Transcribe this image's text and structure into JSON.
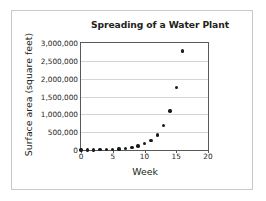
{
  "chart_data": {
    "type": "scatter",
    "title": "Spreading of a Water Plant",
    "xlabel": "Week",
    "ylabel": "Surface area (square feet)",
    "x": [
      0,
      1,
      2,
      3,
      4,
      5,
      6,
      7,
      8,
      9,
      10,
      11,
      12,
      13,
      14,
      15,
      16
    ],
    "values": [
      1000,
      2000,
      4000,
      8000,
      16000,
      31000,
      62000,
      125000,
      12000,
      25000,
      100000,
      175000,
      265000,
      420000,
      680000,
      1090000,
      1750000
    ],
    "series": [
      {
        "name": "Surface area",
        "values": [
          1000,
          2000,
          4000,
          8000,
          16000,
          20000,
          30000,
          45000,
          70000,
          110000,
          175000,
          265000,
          420000,
          680000,
          1090000,
          1750000,
          2780000
        ]
      }
    ],
    "xlim": [
      0,
      20
    ],
    "ylim": [
      0,
      3000000
    ],
    "xticks": [
      0,
      5,
      10,
      15,
      20
    ],
    "xtick_labels": [
      "0",
      "5",
      "10",
      "15",
      "20"
    ],
    "yticks": [
      0,
      500000,
      1000000,
      1500000,
      2000000,
      2500000,
      3000000
    ],
    "ytick_labels": [
      "0",
      "500,000",
      "1,000,000",
      "1,500,000",
      "2,000,000",
      "2,500,000",
      "3,000,000"
    ],
    "grid": "horizontal",
    "legend": "none",
    "marker_color": "#1a1a1a",
    "frame_color": "#58595b",
    "gridline_color": "#d4d4d4"
  }
}
